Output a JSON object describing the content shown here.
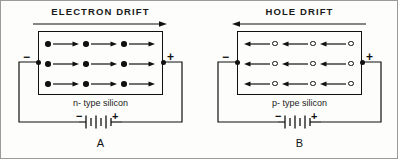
{
  "figure": {
    "background_color": "#fdfdfb",
    "ink_color": "#111111",
    "border_color": "#9a9a9a"
  },
  "panels": [
    {
      "id": "A",
      "letter": "A",
      "drift_title": "ELECTRON DRIFT",
      "drift_direction": "right",
      "material_label": "n- type silicon",
      "carrier_type": "electron",
      "carrier_glyph": "filled-dot",
      "carrier_rows": 3,
      "carrier_columns": 3,
      "carrier_arrow_direction": "right",
      "left_terminal_sign": "−",
      "right_terminal_sign": "+",
      "battery": {
        "left_sign": "−",
        "right_sign": "+",
        "cells": 3
      }
    },
    {
      "id": "B",
      "letter": "B",
      "drift_title": "HOLE DRIFT",
      "drift_direction": "left",
      "material_label": "p- type  silicon",
      "carrier_type": "hole",
      "carrier_glyph": "open-circle",
      "carrier_rows": 3,
      "carrier_columns": 3,
      "carrier_arrow_direction": "left",
      "left_terminal_sign": "−",
      "right_terminal_sign": "+",
      "battery": {
        "left_sign": "−",
        "right_sign": "+",
        "cells": 3
      }
    }
  ]
}
